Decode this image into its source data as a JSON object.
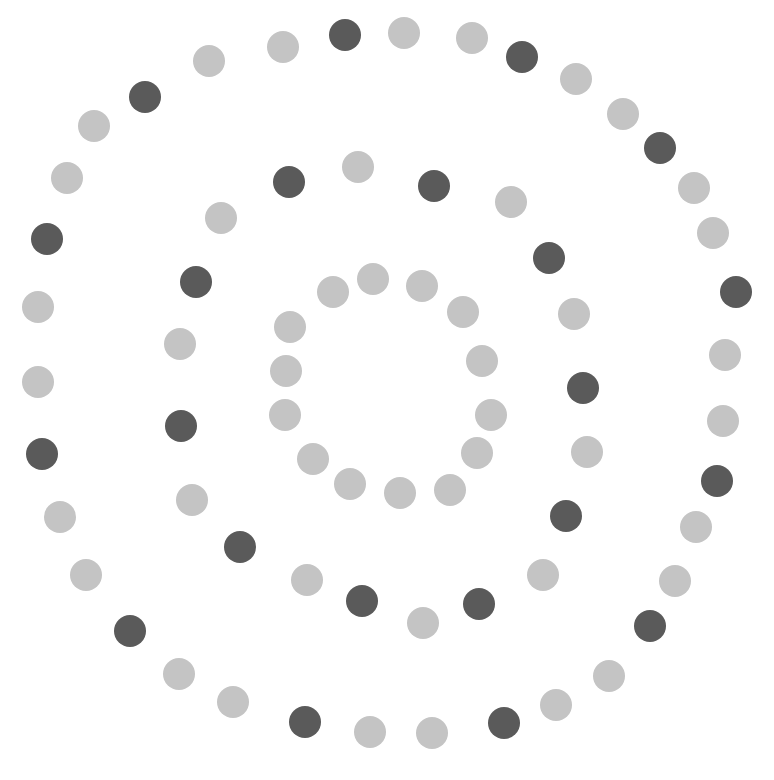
{
  "canvas": {
    "width": 774,
    "height": 780,
    "background": "#ffffff"
  },
  "colors": {
    "dark": "#5a5a5a",
    "light": "#c4c4c4"
  },
  "dot_diameter": 32,
  "rings": [
    {
      "name": "outer",
      "dots": [
        {
          "x": 345,
          "y": 35,
          "tone": "dark"
        },
        {
          "x": 404,
          "y": 33,
          "tone": "light"
        },
        {
          "x": 472,
          "y": 38,
          "tone": "light"
        },
        {
          "x": 522,
          "y": 57,
          "tone": "dark"
        },
        {
          "x": 576,
          "y": 79,
          "tone": "light"
        },
        {
          "x": 623,
          "y": 114,
          "tone": "light"
        },
        {
          "x": 660,
          "y": 148,
          "tone": "dark"
        },
        {
          "x": 694,
          "y": 188,
          "tone": "light"
        },
        {
          "x": 713,
          "y": 233,
          "tone": "light"
        },
        {
          "x": 736,
          "y": 292,
          "tone": "dark"
        },
        {
          "x": 725,
          "y": 355,
          "tone": "light"
        },
        {
          "x": 723,
          "y": 421,
          "tone": "light"
        },
        {
          "x": 717,
          "y": 481,
          "tone": "dark"
        },
        {
          "x": 696,
          "y": 527,
          "tone": "light"
        },
        {
          "x": 675,
          "y": 581,
          "tone": "light"
        },
        {
          "x": 650,
          "y": 626,
          "tone": "dark"
        },
        {
          "x": 609,
          "y": 676,
          "tone": "light"
        },
        {
          "x": 556,
          "y": 705,
          "tone": "light"
        },
        {
          "x": 504,
          "y": 723,
          "tone": "dark"
        },
        {
          "x": 432,
          "y": 733,
          "tone": "light"
        },
        {
          "x": 370,
          "y": 732,
          "tone": "light"
        },
        {
          "x": 305,
          "y": 722,
          "tone": "dark"
        },
        {
          "x": 233,
          "y": 702,
          "tone": "light"
        },
        {
          "x": 179,
          "y": 674,
          "tone": "light"
        },
        {
          "x": 130,
          "y": 631,
          "tone": "dark"
        },
        {
          "x": 86,
          "y": 575,
          "tone": "light"
        },
        {
          "x": 60,
          "y": 517,
          "tone": "light"
        },
        {
          "x": 42,
          "y": 454,
          "tone": "dark"
        },
        {
          "x": 38,
          "y": 382,
          "tone": "light"
        },
        {
          "x": 38,
          "y": 307,
          "tone": "light"
        },
        {
          "x": 47,
          "y": 239,
          "tone": "dark"
        },
        {
          "x": 67,
          "y": 178,
          "tone": "light"
        },
        {
          "x": 94,
          "y": 126,
          "tone": "light"
        },
        {
          "x": 145,
          "y": 97,
          "tone": "dark"
        },
        {
          "x": 209,
          "y": 61,
          "tone": "light"
        },
        {
          "x": 283,
          "y": 47,
          "tone": "light"
        }
      ]
    },
    {
      "name": "middle",
      "dots": [
        {
          "x": 289,
          "y": 182,
          "tone": "dark"
        },
        {
          "x": 358,
          "y": 167,
          "tone": "light"
        },
        {
          "x": 434,
          "y": 186,
          "tone": "dark"
        },
        {
          "x": 511,
          "y": 202,
          "tone": "light"
        },
        {
          "x": 549,
          "y": 258,
          "tone": "dark"
        },
        {
          "x": 574,
          "y": 314,
          "tone": "light"
        },
        {
          "x": 583,
          "y": 388,
          "tone": "dark"
        },
        {
          "x": 587,
          "y": 452,
          "tone": "light"
        },
        {
          "x": 566,
          "y": 516,
          "tone": "dark"
        },
        {
          "x": 543,
          "y": 575,
          "tone": "light"
        },
        {
          "x": 479,
          "y": 604,
          "tone": "dark"
        },
        {
          "x": 423,
          "y": 623,
          "tone": "light"
        },
        {
          "x": 362,
          "y": 601,
          "tone": "dark"
        },
        {
          "x": 307,
          "y": 580,
          "tone": "light"
        },
        {
          "x": 240,
          "y": 547,
          "tone": "dark"
        },
        {
          "x": 192,
          "y": 500,
          "tone": "light"
        },
        {
          "x": 181,
          "y": 426,
          "tone": "dark"
        },
        {
          "x": 180,
          "y": 344,
          "tone": "light"
        },
        {
          "x": 196,
          "y": 282,
          "tone": "dark"
        },
        {
          "x": 221,
          "y": 218,
          "tone": "light"
        }
      ]
    },
    {
      "name": "inner",
      "dots": [
        {
          "x": 373,
          "y": 279,
          "tone": "light"
        },
        {
          "x": 422,
          "y": 286,
          "tone": "light"
        },
        {
          "x": 463,
          "y": 312,
          "tone": "light"
        },
        {
          "x": 482,
          "y": 361,
          "tone": "light"
        },
        {
          "x": 491,
          "y": 415,
          "tone": "light"
        },
        {
          "x": 477,
          "y": 453,
          "tone": "light"
        },
        {
          "x": 450,
          "y": 490,
          "tone": "light"
        },
        {
          "x": 400,
          "y": 493,
          "tone": "light"
        },
        {
          "x": 350,
          "y": 484,
          "tone": "light"
        },
        {
          "x": 313,
          "y": 459,
          "tone": "light"
        },
        {
          "x": 285,
          "y": 415,
          "tone": "light"
        },
        {
          "x": 286,
          "y": 371,
          "tone": "light"
        },
        {
          "x": 290,
          "y": 327,
          "tone": "light"
        },
        {
          "x": 333,
          "y": 292,
          "tone": "light"
        }
      ]
    }
  ]
}
